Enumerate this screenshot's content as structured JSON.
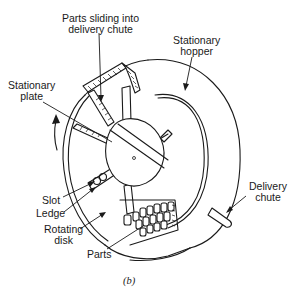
{
  "figure": {
    "caption": "(b)",
    "labels": {
      "parts_sliding": [
        "Parts sliding into",
        "delivery chute"
      ],
      "stationary_hopper": [
        "Stationary",
        "hopper"
      ],
      "stationary_plate": [
        "Stationary",
        "plate"
      ],
      "slot": "Slot",
      "ledge": "Ledge",
      "rotating_disk": [
        "Rotating",
        "disk"
      ],
      "parts": "Parts",
      "delivery_chute": [
        "Delivery",
        "chute"
      ]
    },
    "icons": {
      "rotation_arrow": "curved-arrow-up"
    },
    "colors": {
      "line": "#1a1a1a",
      "background": "#ffffff"
    }
  }
}
